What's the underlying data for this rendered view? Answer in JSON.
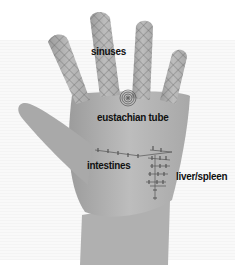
{
  "figure": {
    "colors": {
      "background": "#ffffff",
      "skin": "#b4b4b4",
      "grid": "#555555",
      "label": "#111111"
    }
  },
  "labels": {
    "sinuses": "sinuses",
    "eustachian_tube": "eustachian tube",
    "intestines": "intestines",
    "liver_spleen": "liver/spleen"
  }
}
